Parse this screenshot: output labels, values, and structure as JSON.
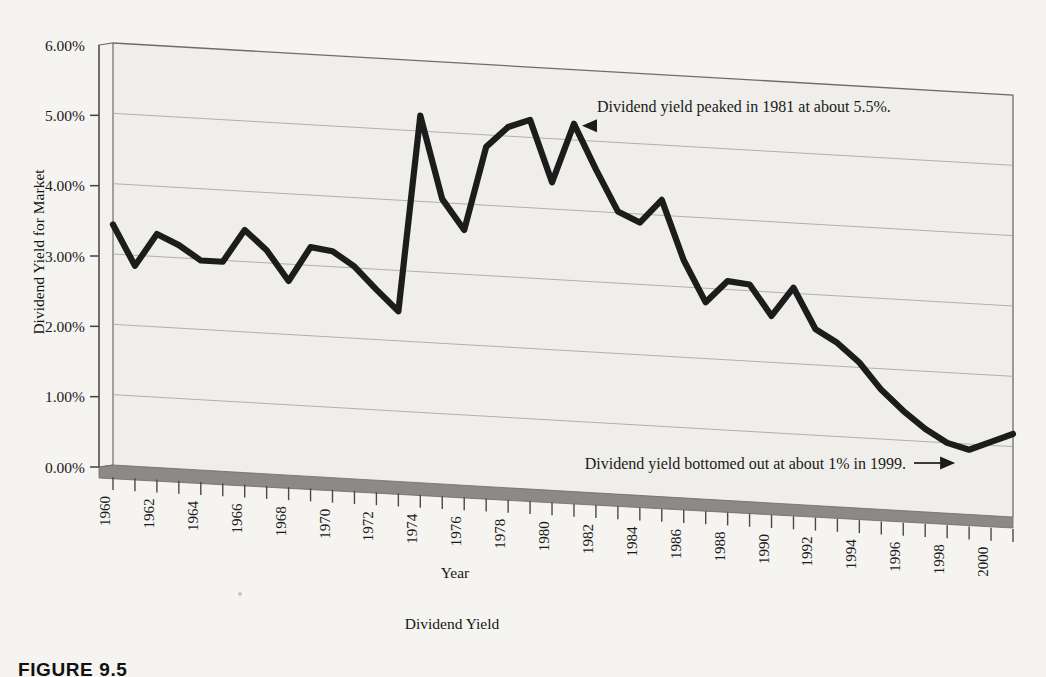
{
  "figure": {
    "caption_label": "FIGURE 9.5",
    "bottom_caption": "Dividend Yield"
  },
  "colors": {
    "page_background": "#f5f4f1",
    "plot_background": "#efeeea",
    "series_line": "#1c1c1c",
    "gridline": "#a9a8a4",
    "axis_line": "#6e6d69",
    "floor_band": "#8b8a86",
    "text": "#1a1a1a"
  },
  "chart_data": {
    "type": "line",
    "title": "",
    "xlabel": "Year",
    "ylabel": "Dividend Yield for Market",
    "ylim": [
      0,
      6
    ],
    "ytick_labels": [
      "0.00%",
      "1.00%",
      "2.00%",
      "3.00%",
      "4.00%",
      "5.00%",
      "6.00%"
    ],
    "ytick_values": [
      0,
      1,
      2,
      3,
      4,
      5,
      6
    ],
    "xlim": [
      1960,
      2001
    ],
    "xtick_labels": [
      "1960",
      "1962",
      "1964",
      "1966",
      "1968",
      "1970",
      "1972",
      "1974",
      "1976",
      "1978",
      "1980",
      "1982",
      "1984",
      "1986",
      "1988",
      "1990",
      "1992",
      "1994",
      "1996",
      "1998",
      "2000"
    ],
    "xtick_values": [
      1960,
      1962,
      1964,
      1966,
      1968,
      1970,
      1972,
      1974,
      1976,
      1978,
      1980,
      1982,
      1984,
      1986,
      1988,
      1990,
      1992,
      1994,
      1996,
      1998,
      2000
    ],
    "minor_tick_interval": 1,
    "grid": true,
    "legend": "none",
    "x": [
      1960,
      1961,
      1962,
      1963,
      1964,
      1965,
      1966,
      1967,
      1968,
      1969,
      1970,
      1971,
      1972,
      1973,
      1974,
      1975,
      1976,
      1977,
      1978,
      1979,
      1980,
      1981,
      1982,
      1983,
      1984,
      1985,
      1986,
      1987,
      1988,
      1989,
      1990,
      1991,
      1992,
      1993,
      1994,
      1995,
      1996,
      1997,
      1998,
      1999,
      2000,
      2001
    ],
    "values": [
      3.42,
      2.85,
      3.32,
      3.18,
      2.98,
      2.98,
      3.45,
      3.18,
      2.76,
      3.26,
      3.22,
      3.02,
      2.71,
      2.42,
      5.22,
      4.05,
      3.63,
      4.83,
      5.13,
      5.25,
      4.38,
      5.23,
      4.6,
      4.02,
      3.88,
      4.22,
      3.38,
      2.8,
      3.12,
      3.09,
      2.66,
      3.08,
      2.51,
      2.33,
      2.07,
      1.7,
      1.42,
      1.18,
      1.0,
      0.92,
      1.05,
      1.18
    ],
    "annotations": [
      {
        "name": "peak-annotation",
        "text": "Dividend yield peaked in 1981 at about 5.5%.",
        "arrow": "left",
        "points_to_year": 1981,
        "points_to_value": 5.23
      },
      {
        "name": "bottom-annotation",
        "text": "Dividend yield bottomed out at about 1% in 1999.",
        "arrow": "right",
        "points_to_year": 1999,
        "points_to_value": 0.92
      }
    ]
  }
}
